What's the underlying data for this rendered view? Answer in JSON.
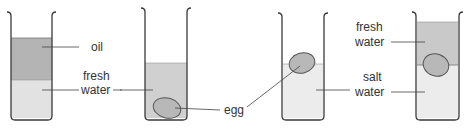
{
  "diagram": {
    "colors": {
      "oil": "#b4b4b4",
      "fresh_water": "#c9c9c9",
      "light_water": "#e4e4e4",
      "salt_water": "#ececec",
      "egg": "#b8b8b8",
      "outline": "#3a3a3a"
    },
    "beakers": [
      {
        "id": 1,
        "layers": [
          "oil",
          "fresh water"
        ],
        "labels": {
          "top": "oil",
          "bottom_line1": "fresh",
          "bottom_line2": "water"
        }
      },
      {
        "id": 2,
        "layers": [
          "fresh water"
        ],
        "egg_position": "sunk to bottom",
        "labels": {
          "egg": "egg"
        }
      },
      {
        "id": 3,
        "layers": [
          "salt water"
        ],
        "egg_position": "floating at surface"
      },
      {
        "id": 4,
        "layers": [
          "fresh water",
          "salt water"
        ],
        "egg_position": "at boundary between layers",
        "labels": {
          "top_line1": "fresh",
          "top_line2": "water",
          "bottom_line1": "salt",
          "bottom_line2": "water"
        }
      }
    ]
  }
}
